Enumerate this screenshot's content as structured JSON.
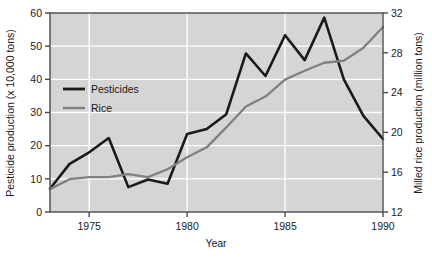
{
  "chart_data": {
    "type": "line",
    "title": "",
    "xlabel": "Year",
    "ylabel": "Pesticide production (x 10,000 tons)",
    "y2label": "Milled rice production (million tons)",
    "grid": true,
    "legend_position": "upper-left-inside",
    "plot_background": "#d5d5d5",
    "gridline_color": "#ffffff",
    "axis_color": "#4a4a4a",
    "xlim": [
      1973,
      1990
    ],
    "xticks": [
      1975,
      1980,
      1985,
      1990
    ],
    "xtick_labels": [
      "1975",
      "1980",
      "1985",
      "1990"
    ],
    "ylim": [
      0,
      60
    ],
    "yticks": [
      0,
      10,
      20,
      30,
      40,
      50,
      60
    ],
    "ytick_labels": [
      "0",
      "10",
      "20",
      "30",
      "40",
      "50",
      "60"
    ],
    "y2lim": [
      12,
      32
    ],
    "y2ticks": [
      12,
      16,
      20,
      24,
      28,
      32
    ],
    "y2tick_labels": [
      "12",
      "16",
      "20",
      "24",
      "28",
      "32"
    ],
    "x": [
      1973,
      1974,
      1975,
      1976,
      1977,
      1978,
      1979,
      1980,
      1981,
      1982,
      1983,
      1984,
      1985,
      1986,
      1987,
      1988,
      1989,
      1990
    ],
    "series": [
      {
        "name": "Pesticides",
        "axis": "left",
        "color": "#1a1a1a",
        "width": 2.6,
        "units": "x 10,000 tons",
        "values": [
          7.0,
          14.5,
          18.0,
          22.3,
          7.5,
          9.8,
          8.5,
          23.5,
          25.0,
          29.5,
          47.8,
          41.0,
          53.3,
          45.8,
          58.6,
          40.0,
          29.0,
          22.0
        ]
      },
      {
        "name": "Rice",
        "axis": "right",
        "color": "#808080",
        "width": 2.3,
        "units": "million tons",
        "values": [
          14.3,
          15.3,
          15.5,
          15.5,
          15.8,
          15.5,
          16.3,
          17.5,
          18.5,
          20.5,
          22.6,
          23.6,
          25.3,
          26.2,
          27.0,
          27.2,
          28.5,
          30.6
        ]
      }
    ],
    "legend": [
      {
        "label": "Pesticides",
        "color": "#1a1a1a",
        "width": 2.8
      },
      {
        "label": "Rice",
        "color": "#808080",
        "width": 2.4
      }
    ]
  }
}
